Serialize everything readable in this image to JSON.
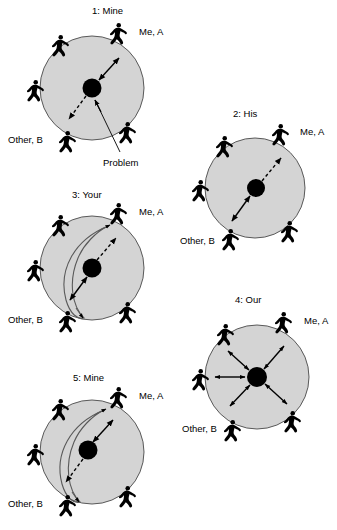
{
  "figure": {
    "kind": "diagram",
    "style": "five grayscale circles, each with five black stick-figure people around the rim and a black dot (the Problem) inside",
    "colors": {
      "circle_fill": "#d4d4d4",
      "circle_stroke": "#595959",
      "person": "#000000",
      "problem_dot": "#000000",
      "text": "#000000",
      "background": "#ffffff"
    },
    "legend_note": "Problem"
  },
  "panels": [
    {
      "id": "panel-1",
      "title": "1: Mine",
      "label_me": "Me, A",
      "label_other": "Other, B",
      "callout": "Problem",
      "arrows": {
        "to_me": "solid-double",
        "to_other": "dashed-single",
        "has_inner_ellipse": false,
        "radial_all": false
      }
    },
    {
      "id": "panel-2",
      "title": "2: His",
      "label_me": "Me, A",
      "label_other": "Other, B",
      "callout": "",
      "arrows": {
        "to_me": "dashed-single",
        "to_other": "solid-double",
        "has_inner_ellipse": false,
        "radial_all": false
      }
    },
    {
      "id": "panel-3",
      "title": "3: Your",
      "label_me": "Me, A",
      "label_other": "Other, B",
      "callout": "",
      "arrows": {
        "to_me": "dashed-single",
        "to_other": "solid-double",
        "has_inner_ellipse": true,
        "radial_all": false
      }
    },
    {
      "id": "panel-4",
      "title": "4: Our",
      "label_me": "Me, A",
      "label_other": "Other, B",
      "callout": "",
      "arrows": {
        "to_me": "solid-double",
        "to_other": "solid-double",
        "has_inner_ellipse": false,
        "radial_all": true
      }
    },
    {
      "id": "panel-5",
      "title": "5: Mine",
      "label_me": "Me, A",
      "label_other": "Other, B",
      "callout": "",
      "arrows": {
        "to_me": "solid-double",
        "to_other": "dashed-single",
        "has_inner_ellipse": true,
        "radial_all": false
      }
    }
  ],
  "people_positions_deg": [
    55,
    125,
    180,
    245,
    315
  ],
  "people_count_per_panel": 5
}
